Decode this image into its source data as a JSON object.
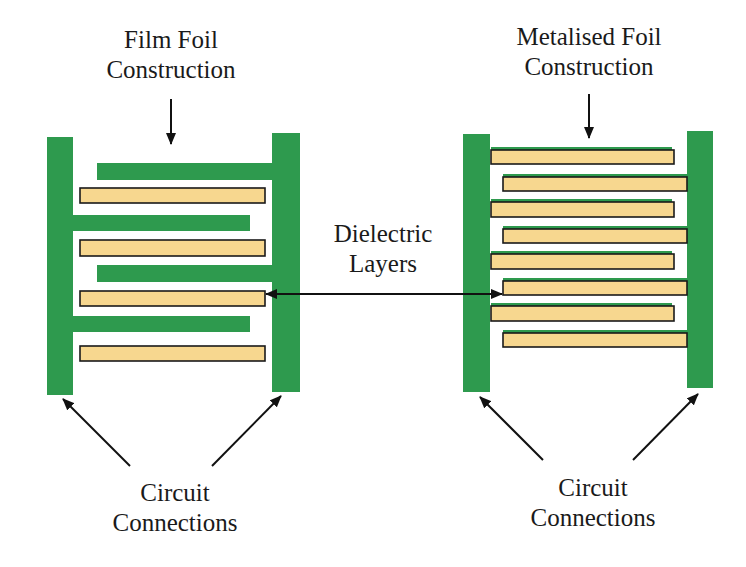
{
  "colors": {
    "electrode_green": "#2e9a4e",
    "dielectric_fill": "#f7d78f",
    "dielectric_stroke": "#1a1a1a",
    "arrow": "#111111",
    "text": "#1a1a1a",
    "background": "#ffffff"
  },
  "labels": {
    "film_foil": {
      "line1": "Film Foil",
      "line2": "Construction"
    },
    "metalised_foil": {
      "line1": "Metalised Foil",
      "line2": "Construction"
    },
    "dielectric": {
      "line1": "Dielectric",
      "line2": "Layers"
    },
    "circuit_left": {
      "line1": "Circuit",
      "line2": "Connections"
    },
    "circuit_right": {
      "line1": "Circuit",
      "line2": "Connections"
    }
  },
  "film_foil_diagram": {
    "terminals": [
      {
        "x": 47,
        "y": 137,
        "w": 26,
        "h": 258
      },
      {
        "x": 272,
        "y": 133,
        "w": 28,
        "h": 259
      }
    ],
    "foils": [
      {
        "x": 97,
        "y": 163,
        "w": 175,
        "h": 17
      },
      {
        "x": 73,
        "y": 215,
        "w": 177,
        "h": 16
      },
      {
        "x": 97,
        "y": 265,
        "w": 175,
        "h": 17
      },
      {
        "x": 73,
        "y": 316,
        "w": 177,
        "h": 16
      }
    ],
    "dielectrics": [
      {
        "x": 80,
        "y": 188,
        "w": 185,
        "h": 15
      },
      {
        "x": 80,
        "y": 240,
        "w": 185,
        "h": 16
      },
      {
        "x": 80,
        "y": 291,
        "w": 185,
        "h": 15
      },
      {
        "x": 80,
        "y": 346,
        "w": 185,
        "h": 15
      }
    ]
  },
  "metalised_foil_diagram": {
    "terminals": [
      {
        "x": 463,
        "y": 134,
        "w": 27,
        "h": 258
      },
      {
        "x": 687,
        "y": 131,
        "w": 26,
        "h": 257
      }
    ],
    "metalised_strips": [
      {
        "x": 491,
        "y": 147,
        "w": 183,
        "h": 17,
        "side": "left"
      },
      {
        "x": 503,
        "y": 174,
        "w": 184,
        "h": 17,
        "side": "right"
      },
      {
        "x": 491,
        "y": 199,
        "w": 183,
        "h": 18,
        "side": "left"
      },
      {
        "x": 503,
        "y": 226,
        "w": 184,
        "h": 17,
        "side": "right"
      },
      {
        "x": 491,
        "y": 251,
        "w": 183,
        "h": 18,
        "side": "left"
      },
      {
        "x": 503,
        "y": 278,
        "w": 184,
        "h": 17,
        "side": "right"
      },
      {
        "x": 491,
        "y": 303,
        "w": 183,
        "h": 18,
        "side": "left"
      },
      {
        "x": 503,
        "y": 330,
        "w": 184,
        "h": 17,
        "side": "right"
      }
    ]
  }
}
